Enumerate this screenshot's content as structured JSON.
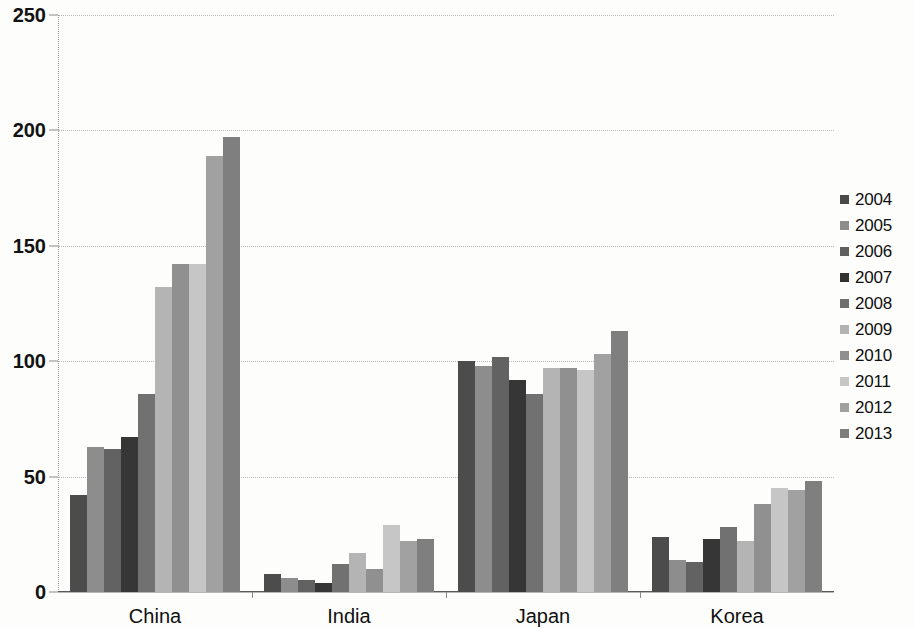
{
  "chart_data": {
    "type": "bar",
    "title": "",
    "subtitle": "",
    "xlabel": "",
    "ylabel": "",
    "categories": [
      "China",
      "India",
      "Japan",
      "Korea"
    ],
    "ylim": [
      0,
      250
    ],
    "yticks": [
      0,
      50,
      100,
      150,
      200,
      250
    ],
    "ytick_labels": [
      "0",
      "50",
      "100",
      "150",
      "200",
      "250"
    ],
    "grid": true,
    "legend_position": "right",
    "series": [
      {
        "name": "2004",
        "color": "#4a4a4a",
        "values": [
          42,
          8,
          100,
          24
        ]
      },
      {
        "name": "2005",
        "color": "#8c8c8c",
        "values": [
          63,
          6,
          98,
          14
        ]
      },
      {
        "name": "2006",
        "color": "#606060",
        "values": [
          62,
          5,
          102,
          13
        ]
      },
      {
        "name": "2007",
        "color": "#333333",
        "values": [
          67,
          4,
          92,
          23
        ]
      },
      {
        "name": "2008",
        "color": "#6f6f6f",
        "values": [
          86,
          12,
          86,
          28
        ]
      },
      {
        "name": "2009",
        "color": "#b3b3b3",
        "values": [
          132,
          17,
          97,
          22
        ]
      },
      {
        "name": "2010",
        "color": "#8f8f8f",
        "values": [
          142,
          10,
          97,
          38
        ]
      },
      {
        "name": "2011",
        "color": "#c6c6c6",
        "values": [
          142,
          29,
          96,
          45
        ]
      },
      {
        "name": "2012",
        "color": "#a0a0a0",
        "values": [
          189,
          22,
          103,
          44
        ]
      },
      {
        "name": "2013",
        "color": "#7d7d7d",
        "values": [
          197,
          23,
          113,
          48
        ]
      }
    ]
  },
  "legend": {
    "items": [
      {
        "label": "2004"
      },
      {
        "label": "2005"
      },
      {
        "label": "2006"
      },
      {
        "label": "2007"
      },
      {
        "label": "2008"
      },
      {
        "label": "2009"
      },
      {
        "label": "2010"
      },
      {
        "label": "2011"
      },
      {
        "label": "2012"
      },
      {
        "label": "2013"
      }
    ]
  },
  "colors": {
    "background": "#fdfdfc",
    "axis": "#5a5a5a",
    "grid": "#b9b9b9",
    "text": "#101010"
  }
}
